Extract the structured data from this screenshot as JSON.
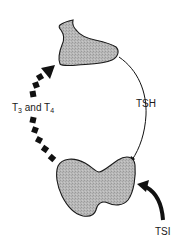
{
  "diagram": {
    "type": "thyroid feedback loop",
    "nodes": [
      {
        "id": "pituitary",
        "label": "",
        "shape": "pituitary gland (stippled gray)"
      },
      {
        "id": "thyroid",
        "label": "",
        "shape": "thyroid gland (stippled gray)"
      }
    ],
    "edges": [
      {
        "from": "pituitary",
        "to": "thyroid",
        "label": "TSH",
        "style": "thin solid curved arrow"
      },
      {
        "from": "thyroid",
        "to": "pituitary",
        "label": "T3 and T4",
        "style": "thick dashed curved arrow"
      },
      {
        "from": "external",
        "to": "thyroid",
        "label": "TSI",
        "style": "thick solid curved arrow"
      }
    ],
    "labels": {
      "hormones_main_1": "T",
      "hormones_sub_1": "3",
      "hormones_and": " and T",
      "hormones_sub_2": "4",
      "tsh": "TSH",
      "tsi": "TSI"
    },
    "colors": {
      "gland_fill": "#b4b4b4",
      "outline": "#1a1a1a",
      "arrow": "#111111",
      "background": "#ffffff"
    }
  }
}
